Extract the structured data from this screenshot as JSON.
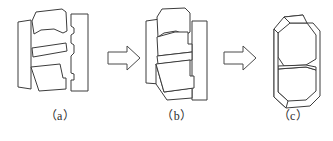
{
  "figure": {
    "background_color": "#ffffff",
    "line_color": "#3c3c3c",
    "arrow_color": "#4a4a4a",
    "width": 333,
    "height": 141
  },
  "captions": [
    {
      "id": "a",
      "label": "（a）"
    },
    {
      "id": "b",
      "label": "（b）"
    },
    {
      "id": "c",
      "label": "（c）"
    }
  ],
  "stages": [
    {
      "id": "a",
      "name": "exploded-parts",
      "description": "Four separated polygonal parts: a tall thin left bar, an upper curved block, a thin slanted middle strip, and a lower wedge, plus a tall notched right bar.",
      "parts": [
        {
          "name": "left-bar",
          "points": "18,22 31,20 31,89 18,87"
        },
        {
          "name": "upper-block",
          "points": "32,21 36,12 62,9 66,12 67,31 63,33 54,29 41,30 34,34"
        },
        {
          "name": "middle-strip",
          "points": "32,48 66,43 67,51 33,57"
        },
        {
          "name": "lower-wedge",
          "points": "31,67 60,64 63,78 66,78 66,89 39,91"
        },
        {
          "name": "right-notched-bar",
          "points": "71,14 88,14 88,91 71,91 71,80 74,80 74,74 71,73 71,56 74,53 74,45 71,43 71,35 74,33 74,28 71,26"
        }
      ]
    },
    {
      "id": "b",
      "name": "parts-converging",
      "description": "The same parts moved together so they overlap; left bar and right bar now flank the stacked blocks.",
      "parts": [
        {
          "name": "left-bar",
          "points": "146,21 160,19 160,84 146,83"
        },
        {
          "name": "right-bar",
          "points": "192,21 207,21 207,100 192,100"
        },
        {
          "name": "upper-block",
          "points": "157,17 162,9 185,8 190,13 190,32 186,35 176,31 164,33 158,37"
        },
        {
          "name": "upper-mid-block",
          "points": "157,37 175,32 188,32 188,44 192,44 192,52 158,56"
        },
        {
          "name": "middle-strip",
          "points": "157,56 192,52 192,60 158,64"
        },
        {
          "name": "lower-wedge",
          "points": "156,64 190,60 190,76 194,76 194,88 164,92"
        },
        {
          "name": "lower-tail",
          "points": "156,64 156,84 167,100 192,98 192,88 164,92"
        }
      ]
    },
    {
      "id": "c",
      "name": "assembled-body",
      "description": "Final assembled solid block with chamfered corners, a horizontal parting line across the middle, and a thin outer shell offset at the left and bottom.",
      "parts": [
        {
          "name": "outer-shell",
          "points": "274,29 284,17 303,15 303,23 313,23 320,31 320,96 310,106 286,108 274,97"
        },
        {
          "name": "body-upper",
          "points": "278,33 290,23 307,23 316,35 316,59 306,65 284,66 278,57"
        },
        {
          "name": "body-lower",
          "points": "278,69 306,67 316,70 316,91 306,100 288,101 278,92"
        },
        {
          "name": "parting-line",
          "points": "278,66 306,65 316,67 316,70 306,67 278,69"
        },
        {
          "name": "left-edge-fold",
          "points": "274,29 278,33 278,92 288,101 286,108 274,97"
        },
        {
          "name": "top-corner-fold",
          "points": "284,17 290,23 307,23 303,15"
        }
      ]
    }
  ],
  "arrows": [
    {
      "name": "arrow-a-to-b",
      "label": "transition from (a) to (b)",
      "points": "108,52 127,52 127,46 140,58 127,70 127,64 108,64"
    },
    {
      "name": "arrow-b-to-c",
      "label": "transition from (b) to (c)",
      "points": "224,52 243,52 243,46 256,58 243,70 243,64 224,64"
    }
  ]
}
